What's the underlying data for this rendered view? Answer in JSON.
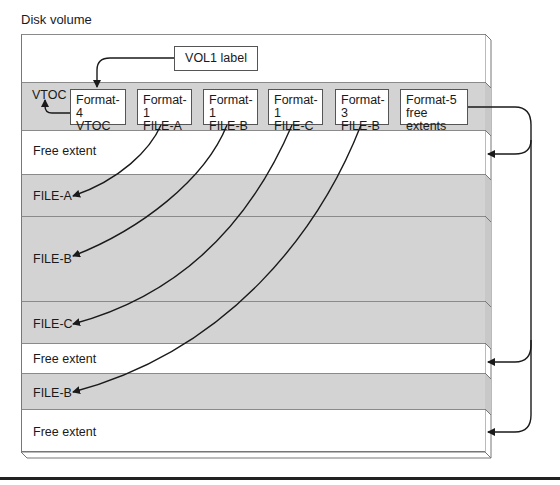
{
  "title": "Disk volume",
  "vol1_label": "VOL1 label",
  "vtoc_label": "VTOC",
  "dscb_boxes": [
    {
      "line1": "Format-4",
      "line2": "VTOC"
    },
    {
      "line1": "Format-1",
      "line2": "FILE-A"
    },
    {
      "line1": "Format-1",
      "line2": "FILE-B"
    },
    {
      "line1": "Format-1",
      "line2": "FILE-C"
    },
    {
      "line1": "Format-3",
      "line2": "FILE-B"
    },
    {
      "line1": "Format-5",
      "line2": "free extents"
    }
  ],
  "extents": [
    {
      "label": "Free extent",
      "type": "free"
    },
    {
      "label": "FILE-A",
      "type": "file"
    },
    {
      "label": "FILE-B",
      "type": "file"
    },
    {
      "label": "FILE-C",
      "type": "file"
    },
    {
      "label": "Free extent",
      "type": "free"
    },
    {
      "label": "FILE-B",
      "type": "file"
    },
    {
      "label": "Free extent",
      "type": "free"
    }
  ],
  "colors": {
    "file_band": "#d3d3d3",
    "free_band": "#ffffff",
    "line": "#1a1a1a"
  }
}
